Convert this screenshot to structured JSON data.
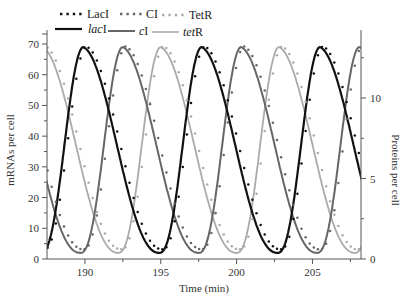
{
  "chart_data": {
    "type": "line",
    "title": "",
    "xlabel": "Time (min)",
    "ylabel": "mRNAs per cell",
    "y2label": "Proteins per cell",
    "xlim": [
      187.5,
      208.2
    ],
    "ylim": [
      0,
      70
    ],
    "y2lim": [
      0,
      13.4
    ],
    "xticks": [
      190,
      195,
      200,
      205
    ],
    "xminor_ticks": [
      192.5,
      197.5,
      202.5,
      207.5
    ],
    "yticks": [
      0,
      10,
      20,
      30,
      40,
      50,
      60,
      70
    ],
    "y2ticks": [
      0,
      5,
      10
    ],
    "y2minor_ticks": [
      2.5,
      7.5,
      12.5
    ],
    "grid": false,
    "legend_position": "top",
    "period_min": 7.8,
    "series": [
      {
        "name": "LacI",
        "kind": "protein",
        "style": "dotted",
        "color": "#111111",
        "peaks_min": [
          190.1,
          197.9,
          205.7
        ],
        "peak_value": 13.2,
        "trough_value": 0.6
      },
      {
        "name": "CI",
        "kind": "protein",
        "style": "dotted",
        "color": "#666666",
        "peaks_min": [
          192.7,
          200.5,
          208.3
        ],
        "peak_value": 13.2,
        "trough_value": 0.6
      },
      {
        "name": "TetR",
        "kind": "protein",
        "style": "dotted",
        "color": "#aaaaaa",
        "peaks_min": [
          187.4,
          195.2,
          203.0
        ],
        "peak_value": 13.2,
        "trough_value": 0.6
      },
      {
        "name": "lacI",
        "kind": "mRNA",
        "style": "solid",
        "color": "#111111",
        "peaks_min": [
          189.9,
          197.7,
          205.5
        ],
        "peak_value": 69,
        "trough_value": 2
      },
      {
        "name": "cI",
        "kind": "mRNA",
        "style": "solid",
        "color": "#666666",
        "peaks_min": [
          192.5,
          200.3,
          208.1
        ],
        "peak_value": 69,
        "trough_value": 2
      },
      {
        "name": "tetR",
        "kind": "mRNA",
        "style": "solid",
        "color": "#aaaaaa",
        "peaks_min": [
          187.2,
          195.0,
          202.8
        ],
        "peak_value": 69,
        "trough_value": 2
      }
    ]
  },
  "legend": {
    "row1": [
      {
        "label": "LacI",
        "style": "dotted",
        "color": "#111111"
      },
      {
        "label": "CI",
        "style": "dotted",
        "color": "#666666"
      },
      {
        "label": "TetR",
        "style": "dotted",
        "color": "#aaaaaa"
      }
    ],
    "row2": [
      {
        "label_italic": "lac",
        "label_rest": "I",
        "style": "solid",
        "color": "#111111"
      },
      {
        "label_italic": "c",
        "label_rest": "I",
        "style": "solid",
        "color": "#666666"
      },
      {
        "label_italic": "tet",
        "label_rest": "R",
        "style": "solid",
        "color": "#aaaaaa"
      }
    ]
  },
  "axes": {
    "x_title": "Time (min)",
    "y_left_title": "mRNAs per cell",
    "y_right_title": "Proteins per cell"
  }
}
